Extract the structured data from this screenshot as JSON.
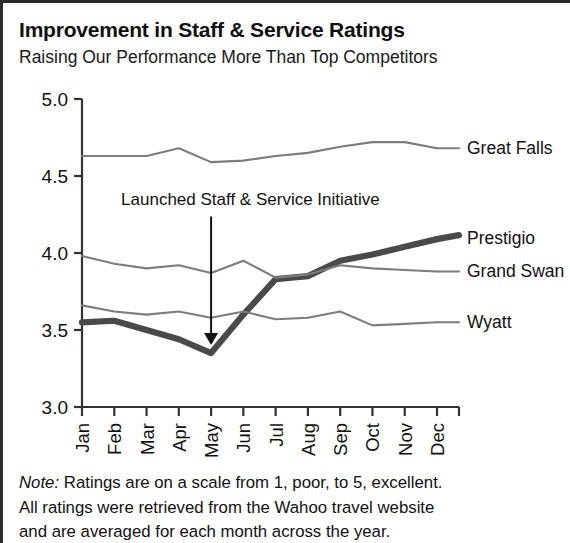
{
  "header": {
    "title": "Improvement in Staff & Service Ratings",
    "subtitle": "Raising Our Performance More Than Top Competitors"
  },
  "note": {
    "lead": "Note:",
    "line1_rest": " Ratings are on a scale from 1, poor, to 5, excellent.",
    "line2": "All ratings were retrieved from the Wahoo travel website",
    "line3": "and are averaged for each month across the year."
  },
  "colors": {
    "frame": "#2b2b2b",
    "axis": "#333333",
    "text": "#111111",
    "highlight_series": "#4a4a4a",
    "competitor_series": "#7d7d7d",
    "annotation_arrow": "#111111"
  },
  "chart_data": {
    "type": "line",
    "title": "Improvement in Staff & Service Ratings",
    "subtitle": "Raising Our Performance More Than Top Competitors",
    "xlabel": "",
    "ylabel": "",
    "categories": [
      "Jan",
      "Feb",
      "Mar",
      "Apr",
      "May",
      "Jun",
      "Jul",
      "Aug",
      "Sep",
      "Oct",
      "Nov",
      "Dec"
    ],
    "ylim": [
      3.0,
      5.0
    ],
    "ytick_labels": [
      "5.0",
      "4.5",
      "4.0",
      "3.5",
      "3.0"
    ],
    "yticks": [
      5.0,
      4.5,
      4.0,
      3.5,
      3.0
    ],
    "grid": false,
    "legend_position": "right-of-line-ends",
    "series": [
      {
        "name": "Great Falls",
        "emphasis": "normal",
        "values": [
          4.63,
          4.63,
          4.63,
          4.68,
          4.59,
          4.6,
          4.63,
          4.65,
          4.69,
          4.72,
          4.72,
          4.68
        ]
      },
      {
        "name": "Prestigio",
        "emphasis": "bold",
        "values": [
          3.55,
          3.56,
          3.5,
          3.44,
          3.35,
          3.6,
          3.83,
          3.85,
          3.95,
          3.99,
          4.04,
          4.09
        ]
      },
      {
        "name": "Grand Swan",
        "emphasis": "normal",
        "values": [
          3.98,
          3.93,
          3.9,
          3.92,
          3.87,
          3.95,
          3.84,
          3.86,
          3.92,
          3.9,
          3.89,
          3.88
        ]
      },
      {
        "name": "Wyatt",
        "emphasis": "normal",
        "values": [
          3.66,
          3.62,
          3.6,
          3.62,
          3.58,
          3.62,
          3.57,
          3.58,
          3.62,
          3.53,
          3.54,
          3.55
        ]
      }
    ],
    "annotations": [
      {
        "text": "Launched Staff & Service Initiative",
        "target_category": "May",
        "target_value": 3.35,
        "label_value": 4.25
      }
    ]
  }
}
